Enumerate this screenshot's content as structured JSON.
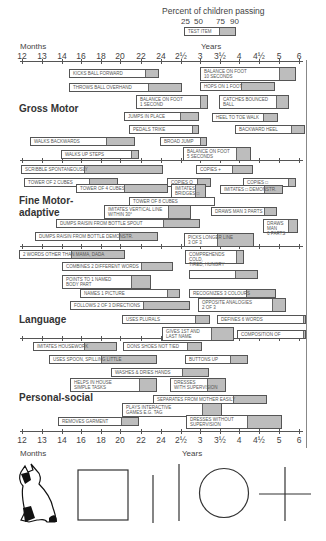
{
  "chart_data": {
    "type": "table",
    "title": "Percent of children passing",
    "legend": {
      "percentiles": [
        "25",
        "50",
        "75",
        "90"
      ],
      "example_label": "TEST ITEM"
    },
    "x_axis": {
      "months_label": "Months",
      "years_label": "Years",
      "ticks": [
        "12",
        "13",
        "14",
        "16",
        "18",
        "20",
        "22",
        "24",
        "2½",
        "3",
        "3½",
        "4",
        "4½",
        "5",
        "6"
      ]
    },
    "sections": [
      {
        "name": "Gross Motor",
        "items": [
          "KICKS BALL FORWARD",
          "THROWS BALL OVERHAND",
          "BALANCE ON FOOT 1 SECOND",
          "JUMPS IN PLACE",
          "PEDALS TRIKE",
          "WALKS BACKWARDS",
          "WALKS UP STEPS",
          "BROAD JUMP",
          "BALANCE ON FOOT 5 SECONDS",
          "BALANCE ON FOOT 10 SECONDS",
          "HOPS ON 1 FOOT",
          "CATCHES BOUNCED BALL",
          "HEEL TO TOE WALK",
          "BACKWARD HEEL"
        ]
      },
      {
        "name": "Fine Motor-adaptive",
        "items": [
          "SCRIBBLE SPONTANEOUSLY",
          "TOWER OF 2 CUBES",
          "TOWER OF 4 CUBES",
          "TOWER OF 8 CUBES",
          "IMITATES VERTICAL LINE WITHIN 30°",
          "DUMPS RAISIN FROM BOTTLE SPOUT",
          "DUMPS RAISIN FROM BOTTLE DEMONSTR.",
          "COPIES O",
          "IMITATES BRIDGES",
          "COPIES +",
          "COPIES □",
          "IMITATES □ DEMONSTR.",
          "DRAWS MAN 3 PARTS",
          "DRAWS MAN 6 PARTS",
          "PICKS LONGER LINE 3 OF 3"
        ]
      },
      {
        "name": "Language",
        "items": [
          "2 WORDS OTHER THAN MAMA, DADA",
          "COMBINES 2 DIFFERENT WORDS",
          "POINTS TO 1 NAMED BODY PART",
          "NAMES 1 PICTURE",
          "FOLLOWS 2 OF 3 DIRECTIONS",
          "USES PLURALS",
          "GIVES 1ST AND LAST NAME",
          "COMPREHENDS COLD, TIRED, HUNGRY",
          "RECOGNIZES 3 COLOURS",
          "OPPOSITE ANALOGIES 2 OF 3",
          "DEFINES 6 WORDS",
          "COMPOSITION OF"
        ]
      },
      {
        "name": "Personal-social",
        "items": [
          "IMITATES HOUSEWORK",
          "USES SPOON, SPILLING LITTLE",
          "WASHES & DRIES HANDS",
          "HELPS IN HOUSE SIMPLE TASKS",
          "REMOVES GARMENT",
          "PLAYS INTERACTIVE GAMES e.g. TAG",
          "DONS SHOES NOT TIED",
          "BUTTONS UP",
          "DRESSES WITH SUPERVISION",
          "SEPARATES FROM MOTHER EASILY",
          "DRESSES WITHOUT SUPERVISION"
        ]
      }
    ],
    "bottom_figures": [
      "cat",
      "square",
      "short vertical line",
      "long vertical line",
      "circle",
      "cross"
    ]
  },
  "header": {
    "title": "Percent of children passing",
    "p25": "25",
    "p50": "50",
    "p75": "75",
    "p90": "90",
    "example": "TEST ITEM",
    "months": "Months",
    "years": "Years"
  },
  "sections": {
    "gross": "Gross Motor",
    "fine": "Fine Motor-\nadaptive",
    "language": "Language",
    "personal": "Personal-social"
  },
  "ticks": [
    "12",
    "13",
    "14",
    "16",
    "18",
    "20",
    "22",
    "24",
    "2½",
    "3",
    "3½",
    "4",
    "4½",
    "5",
    "6"
  ],
  "bars": [
    {
      "x": 69,
      "y": 69,
      "w1": 75,
      "w2": 15,
      "t": "KICKS BALL FORWARD",
      "tall": false
    },
    {
      "x": 69,
      "y": 83,
      "w1": 78,
      "w2": 35,
      "t": "THROWS BALL OVERHAND",
      "tall": false
    },
    {
      "x": 136,
      "y": 95,
      "w1": 63,
      "w2": 9,
      "t": "BALANCE ON FOOT\n1 SECOND",
      "tall": true
    },
    {
      "x": 124,
      "y": 112,
      "w1": 55,
      "w2": 20,
      "t": "JUMPS IN PLACE",
      "tall": false
    },
    {
      "x": 129,
      "y": 125,
      "w1": 62,
      "w2": 8,
      "t": "PEDALS TRIKE",
      "tall": false
    },
    {
      "x": 30,
      "y": 137,
      "w1": 75,
      "w2": 30,
      "t": "WALKS BACKWARDS",
      "tall": false
    },
    {
      "x": 61,
      "y": 150,
      "w1": 69,
      "w2": 9,
      "t": "WALKS UP STEPS",
      "tall": false
    },
    {
      "x": 160,
      "y": 137,
      "w1": 39,
      "w2": 8,
      "t": "BROAD JUMP",
      "tall": false
    },
    {
      "x": 183,
      "y": 147,
      "w1": 52,
      "w2": 16,
      "t": "BALANCE ON FOOT\n5 SECONDS",
      "tall": true
    },
    {
      "x": 200,
      "y": 67,
      "w1": 78,
      "w2": 18,
      "t": "BALANCE ON FOOT\n10 SECONDS",
      "tall": true
    },
    {
      "x": 200,
      "y": 82,
      "w1": 40,
      "w2": 35,
      "t": "HOPS ON 1 FOOT",
      "tall": false
    },
    {
      "x": 219,
      "y": 95,
      "w1": 56,
      "w2": 14,
      "t": "CATCHES BOUNCED\nBALL",
      "tall": true
    },
    {
      "x": 212,
      "y": 113,
      "w1": 50,
      "w2": 16,
      "t": "HEEL TO TOE WALK",
      "tall": false
    },
    {
      "x": 235,
      "y": 125,
      "w1": 55,
      "w2": 15,
      "t": "BACKWARD HEEL",
      "tall": false
    },
    {
      "x": 21,
      "y": 165,
      "w1": 62,
      "w2": 80,
      "t": "SCRIBBLE SPONTANEOUSLY",
      "tall": false
    },
    {
      "x": 24,
      "y": 178,
      "w1": 64,
      "w2": 30,
      "t": "TOWER OF 2 CUBES",
      "tall": false
    },
    {
      "x": 76,
      "y": 184,
      "w1": 47,
      "w2": 45,
      "t": "TOWER OF 4 CUBES",
      "tall": false
    },
    {
      "x": 129,
      "y": 197,
      "w1": 86,
      "w2": 0,
      "t": "TOWER OF 8 CUBES",
      "tall": false
    },
    {
      "x": 104,
      "y": 205,
      "w1": 63,
      "w2": 24,
      "t": "IMITATES VERTICAL LINE\nWITHIN 30°",
      "tall": true
    },
    {
      "x": 56,
      "y": 219,
      "w1": 106,
      "w2": 38,
      "t": "DUMPS RAISIN FROM BOTTLE SPOUT",
      "tall": false
    },
    {
      "x": 35,
      "y": 232,
      "w1": 83,
      "w2": 40,
      "t": "DUMPS RAISIN FROM BOTTLE DEMONSTR.",
      "tall": false
    },
    {
      "x": 196,
      "y": 165,
      "w1": 35,
      "w2": 22,
      "t": "COPIES +",
      "tall": false
    },
    {
      "x": 167,
      "y": 178,
      "w1": 29,
      "w2": 15,
      "t": "COPIES O",
      "tall": false
    },
    {
      "x": 171,
      "y": 184,
      "w1": 23,
      "w2": 12,
      "t": "IMITATES\nBRIDGES □",
      "tall": true
    },
    {
      "x": 243,
      "y": 178,
      "w1": 44,
      "w2": 9,
      "t": "COPIES □",
      "tall": false
    },
    {
      "x": 220,
      "y": 185,
      "w1": 43,
      "w2": 20,
      "t": "IMITATES □ DEMONSTR.",
      "tall": false
    },
    {
      "x": 211,
      "y": 207,
      "w1": 52,
      "w2": 14,
      "t": "DRAWS MAN 3 PARTS",
      "tall": false
    },
    {
      "x": 263,
      "y": 219,
      "w1": 24,
      "w2": 11,
      "t": "DRAWS\nMAN\n6 PARTS",
      "tall": true
    },
    {
      "x": 184,
      "y": 233,
      "w1": 32,
      "w2": 38,
      "t": "PICKS LONGER LINE\n3 OF 3",
      "tall": true
    },
    {
      "x": 19,
      "y": 250,
      "w1": 51,
      "w2": 55,
      "t": "2 WORDS OTHER THAN MAMA, DADA",
      "tall": false
    },
    {
      "x": 62,
      "y": 262,
      "w1": 78,
      "w2": 33,
      "t": "COMBINES 2 DIFFERENT WORDS",
      "tall": false
    },
    {
      "x": 62,
      "y": 275,
      "w1": 68,
      "w2": 21,
      "t": "POINTS TO 1 NAMED\nBODY PART",
      "tall": true
    },
    {
      "x": 80,
      "y": 289,
      "w1": 86,
      "w2": 14,
      "t": "NAMES 1 PICTURE",
      "tall": false
    },
    {
      "x": 70,
      "y": 301,
      "w1": 72,
      "w2": 48,
      "t": "FOLLOWS 2 OF 3 DIRECTIONS",
      "tall": false
    },
    {
      "x": 122,
      "y": 315,
      "w1": 72,
      "w2": 16,
      "t": "USES PLURALS",
      "tall": false
    },
    {
      "x": 162,
      "y": 327,
      "w1": 48,
      "w2": 24,
      "t": "GIVES 1ST AND\nLAST NAME",
      "tall": true
    },
    {
      "x": 185,
      "y": 250,
      "w1": 50,
      "w2": 9,
      "t": "COMPREHENDS\nCOLD,\nTIRED, HUNGRY",
      "tall": true
    },
    {
      "x": 189,
      "y": 270,
      "w1": 45,
      "w2": 24,
      "t": "",
      "tall": false
    },
    {
      "x": 189,
      "y": 289,
      "w1": 56,
      "w2": 31,
      "t": "RECOGNIZES 3 COLOURS",
      "tall": false
    },
    {
      "x": 198,
      "y": 298,
      "w1": 73,
      "w2": 15,
      "t": "OPPOSITE ANALOGIES\n2 OF 3",
      "tall": true
    },
    {
      "x": 217,
      "y": 315,
      "w1": 85,
      "w2": 4,
      "t": "DEFINES 6 WORDS",
      "tall": false
    },
    {
      "x": 237,
      "y": 330,
      "w1": 65,
      "w2": 4,
      "t": "COMPOSITION OF",
      "tall": false
    },
    {
      "x": 33,
      "y": 342,
      "w1": 50,
      "w2": 34,
      "t": "IMITATES HOUSEWORK",
      "tall": false
    },
    {
      "x": 49,
      "y": 355,
      "w1": 51,
      "w2": 57,
      "t": "USES SPOON, SPILLING LITTLE",
      "tall": false
    },
    {
      "x": 111,
      "y": 368,
      "w1": 70,
      "w2": 28,
      "t": "WASHES & DRIES HANDS",
      "tall": false
    },
    {
      "x": 70,
      "y": 378,
      "w1": 68,
      "w2": 19,
      "t": "HELPS IN HOUSE\nSIMPLE TASKS",
      "tall": true
    },
    {
      "x": 58,
      "y": 417,
      "w1": 62,
      "w2": 19,
      "t": "REMOVES GARMENT",
      "tall": false
    },
    {
      "x": 122,
      "y": 403,
      "w1": 79,
      "w2": 21,
      "t": "PLAYS INTERACTIVE\nGAMES e.g. TAG",
      "tall": true
    },
    {
      "x": 123,
      "y": 342,
      "w1": 63,
      "w2": 16,
      "t": "DONS SHOES NOT TIED",
      "tall": false
    },
    {
      "x": 185,
      "y": 355,
      "w1": 44,
      "w2": 19,
      "t": "BUTTONS UP",
      "tall": false
    },
    {
      "x": 170,
      "y": 378,
      "w1": 36,
      "w2": 20,
      "t": "DRESSES\nWITH SUPERVISION",
      "tall": true
    },
    {
      "x": 153,
      "y": 395,
      "w1": 79,
      "w2": 35,
      "t": "SEPARATES FROM MOTHER EASILY",
      "tall": false
    },
    {
      "x": 186,
      "y": 415,
      "w1": 60,
      "w2": 36,
      "t": "DRESSES WITHOUT\nSUPERVISION",
      "tall": true
    }
  ]
}
